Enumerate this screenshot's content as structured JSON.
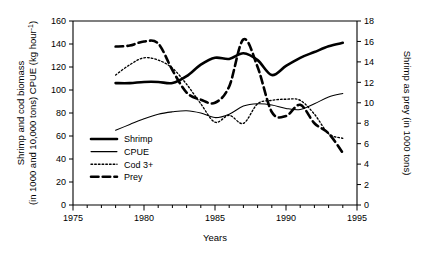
{
  "figure": {
    "background": "#ffffff",
    "line_color": "#000000"
  },
  "axes": {
    "x": {
      "title": "Years",
      "min": 1975,
      "max": 1995,
      "major_ticks": [
        1975,
        1980,
        1985,
        1990,
        1995
      ],
      "major_labels": [
        "1975",
        "1980",
        "1985",
        "1990",
        "1995"
      ],
      "minor_step": 1
    },
    "y_left": {
      "title_line1": "Shrimp and cod biomass",
      "title_line2": "(in 1000 and 10,000 tons) CPUE (kg hour",
      "title_sup": "-1",
      "title_close": ")",
      "min": 0,
      "max": 160,
      "ticks": [
        0,
        20,
        40,
        60,
        80,
        100,
        120,
        140,
        160
      ],
      "labels": [
        "0",
        "20",
        "40",
        "60",
        "80",
        "100",
        "120",
        "140",
        "160"
      ]
    },
    "y_right": {
      "title": "Shrimp as prey (in 1000 tons)",
      "min": 0,
      "max": 18,
      "ticks": [
        0,
        2,
        4,
        6,
        8,
        10,
        12,
        14,
        16,
        18
      ],
      "labels": [
        "0",
        "2",
        "4",
        "6",
        "8",
        "10",
        "12",
        "14",
        "16",
        "18"
      ]
    }
  },
  "legend": {
    "position": "inside-lower-left",
    "items": [
      {
        "label": "Shrimp",
        "style": "thick-solid",
        "axis": "left"
      },
      {
        "label": "CPUE",
        "style": "thin-solid",
        "axis": "left"
      },
      {
        "label": "Cod 3+",
        "style": "fine-dotted",
        "axis": "left"
      },
      {
        "label": "Prey",
        "style": "thick-dashed",
        "axis": "right"
      }
    ]
  },
  "chart_data": {
    "type": "line",
    "title": "",
    "xlabel": "Years",
    "ylabel": "Shrimp and cod biomass (in 1000 and 10,000 tons) CPUE (kg hour-1)",
    "y2label": "Shrimp as prey (in 1000 tons)",
    "xlim": [
      1975,
      1995
    ],
    "ylim": [
      0,
      160
    ],
    "y2lim": [
      0,
      18
    ],
    "grid": false,
    "legend_position": "inside lower left",
    "x": [
      1978,
      1979,
      1980,
      1981,
      1982,
      1983,
      1984,
      1985,
      1986,
      1987,
      1988,
      1989,
      1990,
      1991,
      1992,
      1993,
      1994
    ],
    "series": [
      {
        "name": "Shrimp",
        "axis": "left",
        "style": "thick-solid",
        "values": [
          106,
          106,
          107,
          107,
          106,
          112,
          122,
          128,
          127,
          132,
          126,
          113,
          121,
          128,
          133,
          138,
          141
        ]
      },
      {
        "name": "CPUE",
        "axis": "left",
        "style": "thin-solid",
        "values": [
          65,
          70,
          75,
          79,
          81,
          82,
          80,
          76,
          79,
          86,
          88,
          87,
          84,
          83,
          88,
          94,
          97
        ]
      },
      {
        "name": "Cod 3+",
        "axis": "left",
        "style": "fine-dotted",
        "values": [
          113,
          122,
          128,
          126,
          119,
          105,
          88,
          72,
          78,
          71,
          88,
          91,
          92,
          91,
          79,
          62,
          58
        ]
      },
      {
        "name": "Prey",
        "axis": "right",
        "style": "thick-dashed",
        "values": [
          15.5,
          15.6,
          16.0,
          15.8,
          13.2,
          11.0,
          10.3,
          10.0,
          11.6,
          16.2,
          13.5,
          9.1,
          8.7,
          9.8,
          8.0,
          7.0,
          5.1
        ]
      }
    ]
  }
}
